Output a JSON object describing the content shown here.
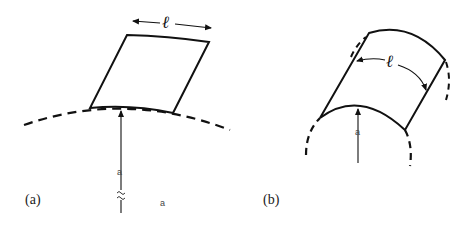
{
  "figure": {
    "panels": [
      {
        "id": "a",
        "label": "(a)",
        "description": "Flat rectangular patch of side length l tangent to a large circle of radius a",
        "length_label": "ℓ",
        "radius_label": "a",
        "radius_label_secondary": "a"
      },
      {
        "id": "b",
        "label": "(b)",
        "description": "Curved cylindrical patch of arc length l wrapped on a circle of radius a",
        "length_label": "ℓ",
        "radius_label": "a"
      }
    ],
    "colors": {
      "stroke": "#111111",
      "background": "#ffffff"
    }
  }
}
